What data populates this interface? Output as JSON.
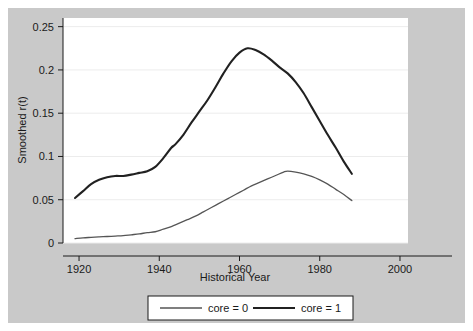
{
  "chart_data": {
    "type": "line",
    "title": "",
    "xlabel": "Historical Year",
    "ylabel": "Smoothed r(t)",
    "xlim": [
      1916,
      2002
    ],
    "ylim": [
      0,
      0.26
    ],
    "xticks": [
      1920,
      1940,
      1960,
      1980,
      2000
    ],
    "xticklabels": [
      "1920",
      "1940",
      "1960",
      "1980",
      "2000"
    ],
    "yticks": [
      0,
      0.05,
      0.1,
      0.15,
      0.2,
      0.25
    ],
    "yticklabels": [
      "0",
      "0.05",
      "0.1",
      "0.15",
      "0.2",
      "0.25"
    ],
    "grid": "horizontal",
    "legend_position": "below",
    "series": [
      {
        "name": "core = 0",
        "color": "#555555",
        "width": 1.3,
        "x": [
          1919,
          1921,
          1923,
          1925,
          1927,
          1929,
          1931,
          1933,
          1935,
          1937,
          1939,
          1941,
          1943,
          1945,
          1947,
          1949,
          1951,
          1953,
          1955,
          1957,
          1959,
          1961,
          1963,
          1965,
          1967,
          1969,
          1971,
          1972,
          1974,
          1976,
          1978,
          1980,
          1982,
          1984,
          1986,
          1988
        ],
        "y": [
          0.005,
          0.006,
          0.0065,
          0.007,
          0.0075,
          0.008,
          0.0085,
          0.0095,
          0.0105,
          0.012,
          0.013,
          0.016,
          0.019,
          0.023,
          0.027,
          0.031,
          0.036,
          0.041,
          0.046,
          0.051,
          0.056,
          0.061,
          0.066,
          0.07,
          0.074,
          0.078,
          0.082,
          0.083,
          0.082,
          0.08,
          0.077,
          0.073,
          0.068,
          0.062,
          0.056,
          0.049
        ]
      },
      {
        "name": "core = 1",
        "color": "#212121",
        "width": 2.1,
        "x": [
          1919,
          1921,
          1923,
          1925,
          1927,
          1929,
          1931,
          1933,
          1935,
          1937,
          1939,
          1941,
          1943,
          1944,
          1946,
          1948,
          1950,
          1952,
          1954,
          1956,
          1958,
          1960,
          1962,
          1964,
          1966,
          1968,
          1970,
          1972,
          1974,
          1976,
          1978,
          1980,
          1982,
          1984,
          1986,
          1988
        ],
        "y": [
          0.052,
          0.06,
          0.068,
          0.073,
          0.076,
          0.0775,
          0.0775,
          0.079,
          0.081,
          0.083,
          0.088,
          0.098,
          0.11,
          0.114,
          0.125,
          0.139,
          0.152,
          0.165,
          0.18,
          0.196,
          0.21,
          0.22,
          0.225,
          0.223,
          0.218,
          0.211,
          0.203,
          0.196,
          0.186,
          0.173,
          0.157,
          0.141,
          0.125,
          0.11,
          0.094,
          0.08
        ]
      }
    ]
  },
  "legend": {
    "entries": [
      {
        "label": "core = 0"
      },
      {
        "label": "core = 1"
      }
    ]
  },
  "axes": {
    "x_title": "Historical Year",
    "y_title": "Smoothed r(t)"
  },
  "colors": {
    "background": "#c9c9c9",
    "plot_background": "#ffffff",
    "grid": "#ececec",
    "axis": "#1a1a1a",
    "series_core0": "#555555",
    "series_core1": "#212121"
  }
}
